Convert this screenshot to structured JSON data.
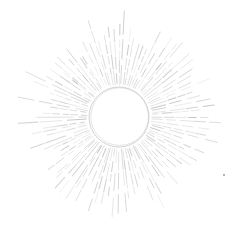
{
  "image": {
    "description": "Hand-drawn sunburst: empty circle with many thin radiating pencil-like rays",
    "background": "#ffffff",
    "stroke_color": "#c8c8c8",
    "ray_color_dark": "#b8b8b8",
    "center": [
      119,
      117
    ],
    "circle_radius": 30,
    "ray_inner_radius": 32,
    "ray_outer_radius_min": 70,
    "ray_outer_radius_max": 108,
    "ray_count": 96,
    "dot": {
      "x": 224,
      "y": 175,
      "r": 1,
      "color": "#9a9a9a"
    }
  }
}
